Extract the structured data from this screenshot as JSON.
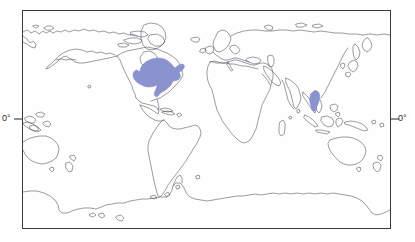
{
  "figure": {
    "type": "world-map",
    "projection": "equirectangular",
    "background_color": "#fdfdfd",
    "frame": {
      "stroke_color": "#3a3a3a",
      "stroke_width": 1,
      "x": 22,
      "y": 10,
      "width": 369,
      "height": 219
    },
    "coastline": {
      "stroke_color": "#4a4a55",
      "stroke_width": 0.55,
      "fill": "none"
    }
  },
  "axis_labels": {
    "left": {
      "text": "0°",
      "name": "equator-label-left",
      "tick": true
    },
    "right": {
      "text": "0°",
      "name": "equator-label-right",
      "tick": true
    }
  },
  "equator": {
    "y_pixel": 119,
    "tick_length": 9,
    "tick_color": "#3a3a3a"
  },
  "distribution_regions": [
    {
      "name": "north-america-range",
      "label": "Eastern and central North America",
      "fill_color": "#8b93cf",
      "stroke_color": "#7a82c4",
      "opacity": 1
    },
    {
      "name": "southeast-asia-range",
      "label": "Mainland Southeast Asia",
      "fill_color": "#8b93cf",
      "stroke_color": "#7a82c4",
      "opacity": 1
    }
  ],
  "colors": {
    "range_blue": "#8b93cf",
    "coastline": "#4a4a55",
    "frame": "#3a3a3a",
    "text": "#2a2a2a",
    "page_background": "#ffffff"
  }
}
